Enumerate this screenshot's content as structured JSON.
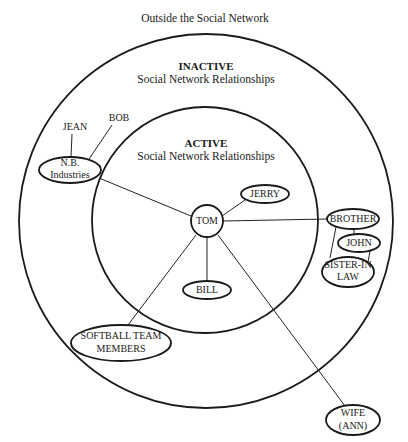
{
  "diagram": {
    "outside_label": "Outside the Social Network",
    "zones": {
      "inactive": {
        "title": "INACTIVE",
        "subtitle": "Social Network Relationships"
      },
      "active": {
        "title": "ACTIVE",
        "subtitle": "Social Network Relationships"
      }
    },
    "center_node": {
      "label": "TOM"
    },
    "nodes": {
      "jerry": {
        "lines": [
          "JERRY"
        ],
        "zone": "active"
      },
      "bill": {
        "lines": [
          "BILL"
        ],
        "zone": "active"
      },
      "brother": {
        "lines": [
          "BROTHER"
        ],
        "zone": "inactive"
      },
      "john": {
        "lines": [
          "JOHN"
        ],
        "zone": "inactive"
      },
      "sister_in_law": {
        "lines": [
          "SISTER-IN",
          "LAW"
        ],
        "zone": "inactive"
      },
      "nb_industries": {
        "lines": [
          "N.B.",
          "Industries"
        ],
        "zone": "inactive"
      },
      "softball": {
        "lines": [
          "SOFTBALL TEAM",
          "MEMBERS"
        ],
        "zone": "inactive"
      },
      "wife": {
        "lines": [
          "WIFE",
          "(ANN)"
        ],
        "zone": "outside"
      }
    },
    "free_labels": {
      "jean": "JEAN",
      "bob": "BOB"
    },
    "edges": [
      [
        "TOM",
        "JERRY"
      ],
      [
        "TOM",
        "BILL"
      ],
      [
        "TOM",
        "BROTHER"
      ],
      [
        "TOM",
        "N.B. Industries"
      ],
      [
        "TOM",
        "SOFTBALL TEAM MEMBERS"
      ],
      [
        "TOM",
        "WIFE (ANN)"
      ],
      [
        "BROTHER",
        "JOHN"
      ],
      [
        "BROTHER",
        "SISTER-IN LAW"
      ],
      [
        "JOHN",
        "SISTER-IN LAW"
      ],
      [
        "N.B. Industries",
        "JEAN"
      ],
      [
        "N.B. Industries",
        "BOB"
      ]
    ],
    "colors": {
      "stroke": "#1a1a1a",
      "background": "#ffffff"
    }
  }
}
